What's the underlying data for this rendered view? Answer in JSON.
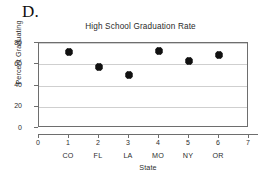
{
  "part_label": "D.",
  "chart_data": {
    "type": "scatter",
    "title": "High School Graduation Rate",
    "xlabel": "State",
    "ylabel": "Percent Graduating",
    "x": [
      1,
      2,
      3,
      4,
      5,
      6
    ],
    "categories": [
      "CO",
      "FL",
      "LA",
      "MO",
      "NY",
      "OR"
    ],
    "values": [
      71.5,
      57,
      50,
      72.5,
      63.5,
      69
    ],
    "series": [
      {
        "name": "Percent Graduating",
        "values": [
          71.5,
          57,
          50,
          72.5,
          63.5,
          69
        ]
      }
    ],
    "points": [
      {
        "x": 1,
        "state": "CO",
        "y": 71.5
      },
      {
        "x": 2,
        "state": "FL",
        "y": 57
      },
      {
        "x": 3,
        "state": "LA",
        "y": 50
      },
      {
        "x": 4,
        "state": "MO",
        "y": 72.5
      },
      {
        "x": 5,
        "state": "NY",
        "y": 63.5
      },
      {
        "x": 6,
        "state": "OR",
        "y": 69
      }
    ],
    "xlim": [
      0,
      7
    ],
    "ylim": [
      0,
      80
    ],
    "xticks": [
      0,
      1,
      2,
      3,
      4,
      5,
      6,
      7
    ],
    "yticks": [
      0,
      20,
      40,
      60,
      80
    ],
    "grid": "horizontal",
    "legend": "none",
    "marker": "diamond",
    "marker_color": "#111111",
    "gridline_color": "#cfcfcf",
    "axis_color": "#6e6e6e"
  }
}
